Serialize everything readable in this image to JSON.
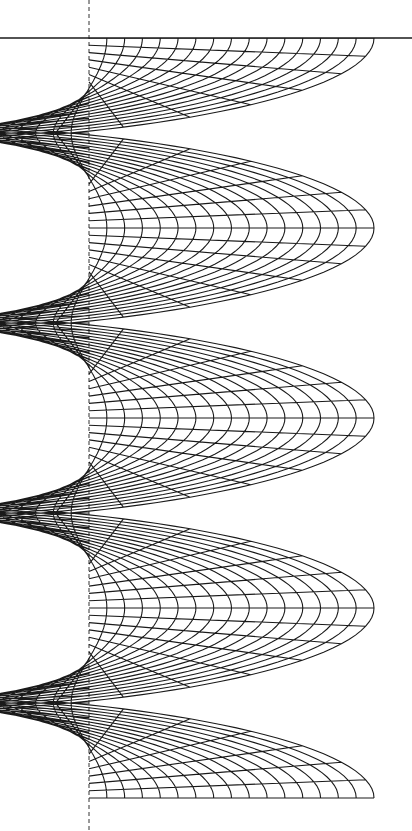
{
  "figure": {
    "kind": "wireframe-surface",
    "canvas": {
      "width": 412,
      "height": 831
    },
    "colors": {
      "background": "#ffffff",
      "mesh": "#1a1a1a",
      "axis": "#333333"
    },
    "axis": {
      "x": 89,
      "y_top": 0,
      "y_bottom": 831,
      "dash": "4,3",
      "style": "dashed"
    },
    "top_edge": {
      "y": 38,
      "x1": 0,
      "x2": 412
    },
    "surface": {
      "center_x": 89,
      "y_start": 38,
      "y_end": 800,
      "turns": 4,
      "pitch": 190,
      "r_inner": 0,
      "r_outer": 285,
      "perspective_tilt": 0.16,
      "radial_lines": 16,
      "angular_steps": 26,
      "clip_right": 412
    }
  }
}
